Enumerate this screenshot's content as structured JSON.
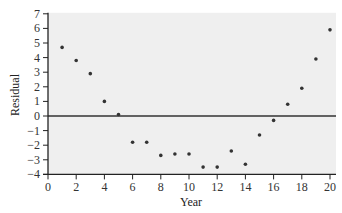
{
  "chart_data": {
    "type": "scatter",
    "title": "",
    "xlabel": "Year",
    "ylabel": "Residual",
    "xlim": [
      0,
      20
    ],
    "ylim": [
      -4,
      7
    ],
    "x_ticks": [
      0,
      2,
      4,
      6,
      8,
      10,
      12,
      14,
      16,
      18,
      20
    ],
    "y_ticks": [
      -4,
      -3,
      -2,
      -1,
      0,
      1,
      2,
      3,
      4,
      5,
      6,
      7
    ],
    "grid": false,
    "reference_line": {
      "y": 0
    },
    "legend": null,
    "series": [
      {
        "name": "Residuals",
        "x": [
          1,
          2,
          3,
          4,
          5,
          6,
          7,
          8,
          9,
          10,
          11,
          12,
          13,
          14,
          15,
          16,
          17,
          18,
          19,
          20
        ],
        "y": [
          4.7,
          3.8,
          2.9,
          1.0,
          0.1,
          -1.8,
          -1.8,
          -2.7,
          -2.6,
          -2.6,
          -3.5,
          -3.5,
          -2.4,
          -3.3,
          -1.3,
          -0.3,
          0.8,
          1.9,
          3.9,
          5.9
        ]
      }
    ]
  },
  "colors": {
    "plot_background": "#efefef",
    "axis": "#222222",
    "points": "#333333",
    "zero_line": "#333333"
  }
}
